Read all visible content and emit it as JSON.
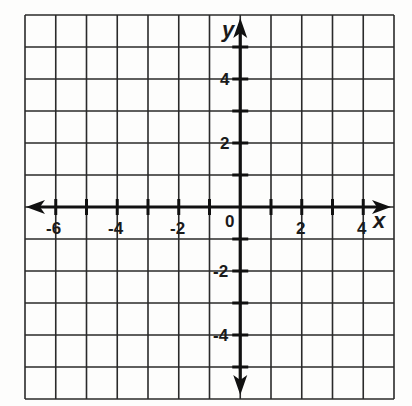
{
  "diagram": {
    "type": "coordinate-plane",
    "x_axis": {
      "label": "x",
      "min": -7,
      "max": 5,
      "tick_step": 1,
      "labeled_ticks": [
        -6,
        -4,
        -2,
        2,
        4
      ]
    },
    "y_axis": {
      "label": "y",
      "min": -6,
      "max": 6,
      "tick_step": 1,
      "labeled_ticks": [
        4,
        2,
        -2,
        -4
      ]
    },
    "origin_label": "0",
    "grid": {
      "columns": 12,
      "rows": 12
    },
    "colors": {
      "grid": "#2a2a2a",
      "axis": "#111111",
      "background": "#fdfdfc"
    }
  },
  "labels": {
    "x_axis": "x",
    "y_axis": "y",
    "origin": "0",
    "x_ticks": [
      "-6",
      "-4",
      "-2",
      "2",
      "4"
    ],
    "y_ticks": [
      "4",
      "2",
      "-2",
      "-4"
    ]
  }
}
